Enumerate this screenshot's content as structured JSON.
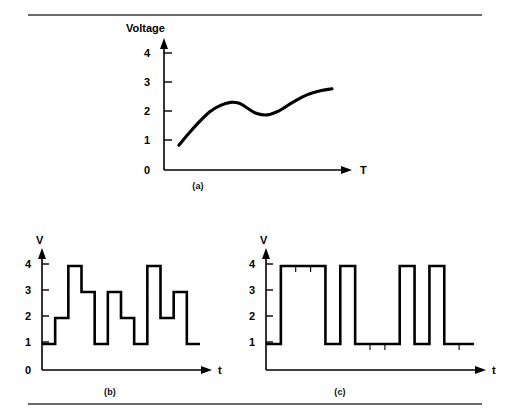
{
  "figure": {
    "background_color": "#ffffff",
    "ink_color": "#000000",
    "rule_color": "#6b6b6b",
    "rules": [
      "top-rule",
      "bottom-rule"
    ],
    "captions": {
      "a": "(a)",
      "b": "(b)",
      "c": "(c)"
    }
  },
  "chart_data": [
    {
      "id": "panel-a",
      "type": "line",
      "title": "",
      "xlabel": "T",
      "ylabel": "Voltage",
      "ylabel_text": "Voltage",
      "xaxis_label_text": "T",
      "ytick_labels": [
        "0",
        "1",
        "2",
        "3",
        "4"
      ],
      "ytick_values": [
        0,
        1,
        2,
        3,
        4
      ],
      "xtick_labels": [],
      "ylim": [
        0,
        4.6
      ],
      "xlim": [
        0,
        10
      ],
      "grid": false,
      "legend": null,
      "caption": "(a)",
      "description": "Smooth analog voltage curve rising, dipping, then rising to a plateau",
      "x": [
        0.85,
        1.4,
        2.0,
        2.6,
        3.2,
        3.8,
        4.3,
        4.8,
        5.3,
        5.9,
        6.6,
        7.4,
        8.2,
        9.0,
        9.6
      ],
      "values": [
        0.85,
        1.25,
        1.65,
        2.0,
        2.22,
        2.33,
        2.3,
        2.12,
        1.95,
        1.9,
        2.05,
        2.35,
        2.6,
        2.74,
        2.8
      ]
    },
    {
      "id": "panel-b",
      "type": "line",
      "subtype": "step",
      "title": "",
      "xlabel": "t",
      "ylabel": "V",
      "ylabel_text": "V",
      "xaxis_label_text": "t",
      "ytick_labels": [
        "0",
        "1",
        "2",
        "3",
        "4"
      ],
      "ytick_values": [
        0,
        1,
        2,
        3,
        4
      ],
      "xtick_labels": [],
      "ylim": [
        0,
        4.6
      ],
      "grid": false,
      "legend": null,
      "caption": "(b)",
      "description": "Multilevel (4-level) quantized staircase signal, 12 symbol intervals",
      "categories": [
        "1",
        "2",
        "3",
        "4",
        "5",
        "6",
        "7",
        "8",
        "9",
        "10",
        "11",
        "12"
      ],
      "values": [
        1,
        2,
        4,
        3,
        1,
        3,
        2,
        1,
        4,
        2,
        3,
        1
      ]
    },
    {
      "id": "panel-c",
      "type": "line",
      "subtype": "step",
      "title": "",
      "xlabel": "t",
      "ylabel": "V",
      "ylabel_text": "V",
      "xaxis_label_text": "t",
      "ytick_labels": [
        "1",
        "2",
        "3",
        "4"
      ],
      "ytick_values": [
        1,
        2,
        3,
        4
      ],
      "xtick_labels": [],
      "ylim": [
        0,
        4.6
      ],
      "grid": false,
      "legend": null,
      "caption": "(c)",
      "description": "Two-level (binary) digital waveform switching between 1 V and 4 V, 12 bit intervals with minor tick marks at bit boundaries",
      "categories": [
        "1",
        "2",
        "3",
        "4",
        "5",
        "6",
        "7",
        "8",
        "9",
        "10",
        "11",
        "12"
      ],
      "values": [
        1,
        4,
        4,
        4,
        1,
        4,
        1,
        1,
        1,
        4,
        1,
        4,
        1,
        1
      ]
    }
  ]
}
